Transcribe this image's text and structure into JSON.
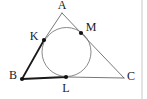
{
  "figure": {
    "kind": "geometry-diagram",
    "canvas": {
      "width": 147,
      "height": 99,
      "background": "#ffffff"
    },
    "style": {
      "thin_stroke": "#555555",
      "thin_width": 0.8,
      "thick_stroke": "#1a1a1a",
      "thick_width": 1.8,
      "circle_stroke": "#6b6b6b",
      "circle_width": 0.8,
      "point_fill": "#111111",
      "point_radius": 2.1,
      "label_color": "#1a1a1a",
      "label_size": 12,
      "rule_stroke": "#c8c8c8"
    },
    "points": [
      {
        "id": "A",
        "label": "A",
        "x": 62,
        "y": 13,
        "label_x": 62,
        "label_y": 6,
        "dot": false
      },
      {
        "id": "B",
        "label": "B",
        "x": 22,
        "y": 79,
        "label_x": 13,
        "label_y": 76,
        "dot": true
      },
      {
        "id": "C",
        "label": "C",
        "x": 124,
        "y": 78,
        "label_x": 131,
        "label_y": 77,
        "dot": false
      },
      {
        "id": "K",
        "label": "K",
        "x": 44,
        "y": 40,
        "label_x": 34,
        "label_y": 37,
        "dot": true
      },
      {
        "id": "L",
        "label": "L",
        "x": 66,
        "y": 77,
        "label_x": 66,
        "label_y": 89,
        "dot": true
      },
      {
        "id": "M",
        "label": "M",
        "x": 81,
        "y": 33,
        "label_x": 91,
        "label_y": 28,
        "dot": true
      }
    ],
    "segments": [
      {
        "id": "AK",
        "from": "A",
        "to": "K",
        "weight": "thin"
      },
      {
        "id": "KB",
        "from": "K",
        "to": "B",
        "weight": "thick"
      },
      {
        "id": "BL",
        "from": "B",
        "to": "L",
        "weight": "thick"
      },
      {
        "id": "LC",
        "from": "L",
        "to": "C",
        "weight": "thin"
      },
      {
        "id": "AM",
        "from": "A",
        "to": "M",
        "weight": "thin"
      },
      {
        "id": "MC",
        "from": "M",
        "to": "C",
        "weight": "thin"
      }
    ],
    "circle": {
      "id": "incircle",
      "cx": 66.5,
      "cy": 52,
      "r": 24.5
    },
    "rule": {
      "id": "right-margin-rule",
      "x": 142,
      "y1": 0,
      "y2": 99
    }
  }
}
